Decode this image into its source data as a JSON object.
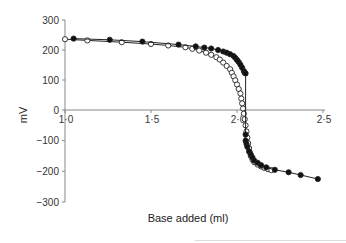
{
  "chart_data": {
    "type": "scatter",
    "title": "",
    "xlabel": "Base added (ml)",
    "ylabel": "mV",
    "xlim": [
      1.0,
      2.5
    ],
    "ylim": [
      -300,
      300
    ],
    "x_ticks": [
      "1·0",
      "1·5",
      "2·0",
      "2·5"
    ],
    "y_ticks": [
      "300",
      "200",
      "100",
      "0",
      "−100",
      "−200",
      "−300"
    ],
    "grid": false,
    "legend": null,
    "series": [
      {
        "name": "filled",
        "marker": "filled-circle",
        "x": [
          1.05,
          1.26,
          1.45,
          1.66,
          1.76,
          1.81,
          1.85,
          1.89,
          1.92,
          1.94,
          1.96,
          1.98,
          1.99,
          2.0,
          2.01,
          2.02,
          2.03,
          2.04,
          2.045,
          2.05,
          2.05,
          2.05,
          2.055,
          2.06,
          2.07,
          2.08,
          2.09,
          2.1,
          2.12,
          2.14,
          2.17,
          2.22,
          2.3,
          2.37,
          2.47
        ],
        "y": [
          238,
          234,
          228,
          218,
          212,
          208,
          205,
          200,
          195,
          191,
          186,
          180,
          174,
          167,
          160,
          151,
          141,
          130,
          124,
          122,
          -80,
          -100,
          -110,
          -120,
          -135,
          -145,
          -155,
          -165,
          -172,
          -180,
          -187,
          -195,
          -203,
          -212,
          -225
        ]
      },
      {
        "name": "open",
        "marker": "open-circle",
        "x": [
          1.0,
          1.13,
          1.33,
          1.5,
          1.6,
          1.7,
          1.74,
          1.78,
          1.82,
          1.85,
          1.88,
          1.9,
          1.92,
          1.94,
          1.96,
          1.97,
          1.98,
          1.99,
          2.0,
          2.01,
          2.02,
          2.025,
          2.03,
          2.035,
          2.04,
          2.045,
          2.05,
          2.055,
          2.06,
          2.065,
          2.07,
          2.075,
          2.08,
          2.09,
          2.1,
          2.12,
          2.14,
          2.16,
          2.18,
          2.2
        ],
        "y": [
          236,
          232,
          226,
          220,
          215,
          209,
          204,
          198,
          191,
          184,
          176,
          168,
          158,
          147,
          136,
          124,
          112,
          99,
          85,
          70,
          55,
          38,
          22,
          5,
          -12,
          -30,
          -50,
          -70,
          -90,
          -108,
          -124,
          -138,
          -150,
          -162,
          -170,
          -178,
          -184,
          -189,
          -193,
          -196
        ]
      }
    ]
  }
}
